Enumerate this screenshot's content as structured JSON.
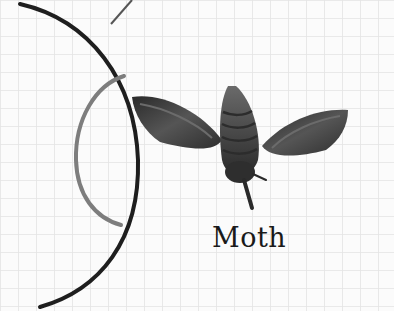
{
  "figure": {
    "label": "Moth",
    "background": "#fbfbfb",
    "grid_color": "#e6e6e6",
    "outer_arc_color": "#1e1e1e",
    "inner_arc_color": "#7a7a7a",
    "moth_color": "#3a3a3a"
  }
}
